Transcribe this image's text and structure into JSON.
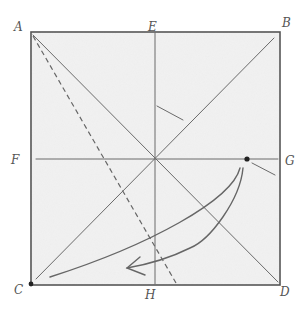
{
  "diagram": {
    "type": "origami-crease-pattern",
    "paper_color": "#f1f1f1",
    "line_color": "#6a6a6a",
    "labels": {
      "A": "A",
      "B": "B",
      "C": "C",
      "D": "D",
      "E": "E",
      "F": "F",
      "G": "G",
      "H": "H"
    },
    "square": {
      "x1": 31,
      "y1": 32,
      "x2": 280,
      "y2": 285
    },
    "creases": [
      {
        "name": "vertical-center-E-H",
        "style": "solid"
      },
      {
        "name": "horizontal-center-F-G",
        "style": "solid"
      },
      {
        "name": "diagonal-A-D",
        "style": "solid"
      },
      {
        "name": "diagonal-B-C",
        "style": "solid"
      },
      {
        "name": "fold-line-from-A",
        "style": "dashed"
      },
      {
        "name": "short-crease-near-center",
        "style": "solid"
      },
      {
        "name": "short-crease-at-G",
        "style": "solid"
      }
    ],
    "points": [
      {
        "name": "dot-G",
        "x": 247,
        "y": 159
      },
      {
        "name": "dot-C",
        "x": 31,
        "y": 284
      }
    ],
    "arrow": {
      "from": "G-dot",
      "to": "C",
      "note": "fold point near G to corner C"
    }
  }
}
